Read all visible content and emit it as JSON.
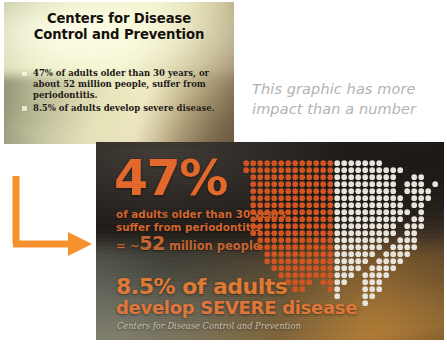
{
  "before_slide": {
    "name": "cdc-text-slide",
    "title": "Centers for Disease Control and Prevention",
    "bullets": [
      "47% of adults older than 30 years, or about 52 million people, suffer from periodontitis.",
      "8.5% of adults develop severe disease."
    ]
  },
  "callout": {
    "note": "This graphic has more impact than a number"
  },
  "arrow": {
    "name": "elbow-arrow",
    "color": "#F5922E",
    "direction": "down-then-right"
  },
  "after_slide": {
    "name": "cdc-infographic-slide",
    "primary_stat": "47%",
    "primary_desc": "of adults older than 30 years suffer from periodontitis",
    "primary_equiv_prefix": "= ~",
    "primary_equiv_number": "52",
    "primary_equiv_suffix": " million people",
    "secondary_line1": "8.5% of adults",
    "secondary_line2": "develop SEVERE disease",
    "source": "Centers for Disease Control and Prevention",
    "accent_orange": "#E4672A",
    "dot_white": "#E8E6DE"
  },
  "chart_data": {
    "type": "pictogram",
    "unit": "dot = share of US adult population",
    "categories": [
      "Affected (periodontitis)",
      "Unaffected"
    ],
    "values": [
      47,
      53
    ],
    "colors": [
      "#D2541F",
      "#E8E6DE"
    ],
    "annotations": [
      "47%",
      "of adults older than 30 years suffer from periodontitis",
      "= ~52 million people",
      "8.5% of adults develop SEVERE disease"
    ],
    "source": "Centers for Disease Control and Prevention",
    "shape": "united-states-dot-matrix",
    "fill_direction": "left-to-right",
    "fill_fraction": 0.47,
    "grid": false,
    "legend": "none"
  }
}
